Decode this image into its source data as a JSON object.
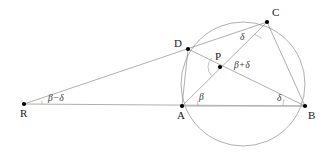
{
  "figure": {
    "width": 325,
    "height": 159,
    "background_color": "#ffffff",
    "line_color": "#8c8c8c",
    "baseline_color": "#b0b0b0",
    "circle_color": "#9a9a9a",
    "vertex_color": "#000000",
    "label_color": "#1a1a1a"
  },
  "circle": {
    "cx": 243,
    "cy": 84,
    "r": 62
  },
  "points": [
    {
      "id": "R",
      "label": "R",
      "x": 24,
      "y": 104,
      "label_x": 20,
      "label_y": 117
    },
    {
      "id": "A",
      "label": "A",
      "x": 182,
      "y": 106,
      "label_x": 177,
      "label_y": 119
    },
    {
      "id": "B",
      "label": "B",
      "x": 305,
      "y": 106,
      "label_x": 308,
      "label_y": 119
    },
    {
      "id": "C",
      "label": "C",
      "x": 267,
      "y": 22,
      "label_x": 272,
      "label_y": 16
    },
    {
      "id": "D",
      "label": "D",
      "x": 188,
      "y": 49,
      "label_x": 174,
      "label_y": 47
    },
    {
      "id": "P",
      "label": "P",
      "x": 220,
      "y": 67,
      "label_x": 215,
      "label_y": 60
    }
  ],
  "segments": [
    {
      "id": "R-B",
      "from": "R",
      "to": "B",
      "kind": "baseline"
    },
    {
      "id": "R-C",
      "from": "R",
      "to": "C",
      "kind": "segment"
    },
    {
      "id": "A-D",
      "from": "A",
      "to": "D",
      "kind": "segment"
    },
    {
      "id": "A-C",
      "from": "A",
      "to": "C",
      "kind": "segment"
    },
    {
      "id": "D-B",
      "from": "D",
      "to": "B",
      "kind": "segment"
    },
    {
      "id": "C-B",
      "from": "C",
      "to": "B",
      "kind": "segment"
    },
    {
      "id": "A-B",
      "from": "A",
      "to": "B",
      "kind": "baseline"
    }
  ],
  "angle_labels": [
    {
      "id": "angle-R",
      "at": "R",
      "text": "β−δ",
      "x": 48,
      "y": 101
    },
    {
      "id": "angle-A",
      "at": "A",
      "text": "β",
      "x": 199,
      "y": 100
    },
    {
      "id": "angle-B",
      "at": "B",
      "text": "δ",
      "x": 277,
      "y": 101
    },
    {
      "id": "angle-C",
      "at": "C",
      "text": "δ",
      "x": 240,
      "y": 40
    },
    {
      "id": "angle-P",
      "at": "P",
      "text": "β+δ",
      "x": 234,
      "y": 68
    }
  ],
  "angle_arcs": [
    {
      "id": "arc-R",
      "cx": 24,
      "cy": 104,
      "r": 18,
      "a0": -10.5,
      "a1": 0
    },
    {
      "id": "arc-A",
      "cx": 182,
      "cy": 106,
      "r": 16,
      "a0": -20,
      "a1": 0
    },
    {
      "id": "arc-B",
      "cx": 305,
      "cy": 106,
      "r": 22,
      "a0": 180,
      "a1": 198
    },
    {
      "id": "arc-C",
      "cx": 267,
      "cy": 22,
      "r": 17,
      "a0": 108,
      "a1": 135
    },
    {
      "id": "arc-P",
      "cx": 220,
      "cy": 67,
      "r": 12,
      "a0": 135,
      "a1": 230
    }
  ]
}
